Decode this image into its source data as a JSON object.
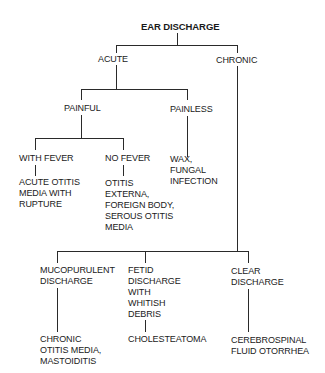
{
  "diagram": {
    "title": "EAR DISCHARGE",
    "nodes": {
      "acute": "ACUTE",
      "chronic": "CHRONIC",
      "painful": "PAINFUL",
      "painless": "PAINLESS",
      "with_fever": "WITH FEVER",
      "no_fever": "NO FEVER",
      "wax_fungal": "WAX,\nFUNGAL\nINFECTION",
      "acute_otitis": "ACUTE OTITIS\nMEDIA WITH\nRUPTURE",
      "otitis_externa": "OTITIS\nEXTERNA,\nFOREIGN BODY,\nSEROUS OTITIS\nMEDIA",
      "mucopurulent": "MUCOPURULENT\nDISCHARGE",
      "fetid": "FETID\nDISCHARGE\nWITH\nWHITISH\nDEBRIS",
      "clear": "CLEAR\nDISCHARGE",
      "chronic_otitis": "CHRONIC\nOTITIS MEDIA,\nMASTOIDITIS",
      "cholesteatoma": "CHOLESTEATOMA",
      "csf": "CEREBROSPINAL\nFLUID OTORRHEA"
    },
    "edges": [
      [
        "EAR DISCHARGE",
        "ACUTE"
      ],
      [
        "EAR DISCHARGE",
        "CHRONIC"
      ],
      [
        "ACUTE",
        "PAINFUL"
      ],
      [
        "ACUTE",
        "PAINLESS"
      ],
      [
        "PAINFUL",
        "WITH FEVER"
      ],
      [
        "PAINFUL",
        "NO FEVER"
      ],
      [
        "PAINLESS",
        "WAX, FUNGAL INFECTION"
      ],
      [
        "WITH FEVER",
        "ACUTE OTITIS MEDIA WITH RUPTURE"
      ],
      [
        "NO FEVER",
        "OTITIS EXTERNA, FOREIGN BODY, SEROUS OTITIS MEDIA"
      ],
      [
        "CHRONIC",
        "MUCOPURULENT DISCHARGE"
      ],
      [
        "CHRONIC",
        "FETID DISCHARGE WITH WHITISH DEBRIS"
      ],
      [
        "CHRONIC",
        "CLEAR DISCHARGE"
      ],
      [
        "MUCOPURULENT DISCHARGE",
        "CHRONIC OTITIS MEDIA, MASTOIDITIS"
      ],
      [
        "FETID DISCHARGE WITH WHITISH DEBRIS",
        "CHOLESTEATOMA"
      ],
      [
        "CLEAR DISCHARGE",
        "CEREBROSPINAL FLUID OTORRHEA"
      ]
    ]
  }
}
